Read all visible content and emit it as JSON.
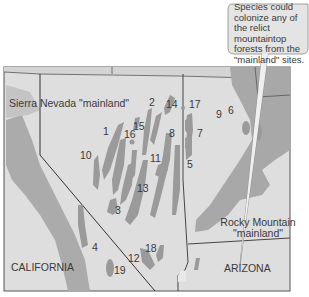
{
  "callout": {
    "text": "Species could colonize any of the relict mountaintop forests from the \"mainland\" sites."
  },
  "regions": {
    "sierra_nevada": "Sierra Nevada \"mainland\"",
    "rocky_mountain_line1": "Rocky Mountain",
    "rocky_mountain_line2": "\"mainland\"",
    "california": "CALIFORNIA",
    "arizona": "ARIZONA"
  },
  "sites": [
    {
      "id": "1",
      "label": "1"
    },
    {
      "id": "2",
      "label": "2"
    },
    {
      "id": "3",
      "label": "3"
    },
    {
      "id": "4",
      "label": "4"
    },
    {
      "id": "5",
      "label": "5"
    },
    {
      "id": "6",
      "label": "6"
    },
    {
      "id": "7",
      "label": "7"
    },
    {
      "id": "8",
      "label": "8"
    },
    {
      "id": "9",
      "label": "9"
    },
    {
      "id": "10",
      "label": "10"
    },
    {
      "id": "11",
      "label": "11"
    },
    {
      "id": "12",
      "label": "12"
    },
    {
      "id": "13",
      "label": "13"
    },
    {
      "id": "14",
      "label": "14"
    },
    {
      "id": "15",
      "label": "15"
    },
    {
      "id": "16",
      "label": "16"
    },
    {
      "id": "17",
      "label": "17"
    },
    {
      "id": "18",
      "label": "18"
    },
    {
      "id": "19",
      "label": "19"
    }
  ],
  "colors": {
    "map_bg": "#dedede",
    "forest": "#9a9a9a",
    "mainland": "#a8a8a8",
    "border": "#444444",
    "callout_bg": "#e2e2e2"
  }
}
